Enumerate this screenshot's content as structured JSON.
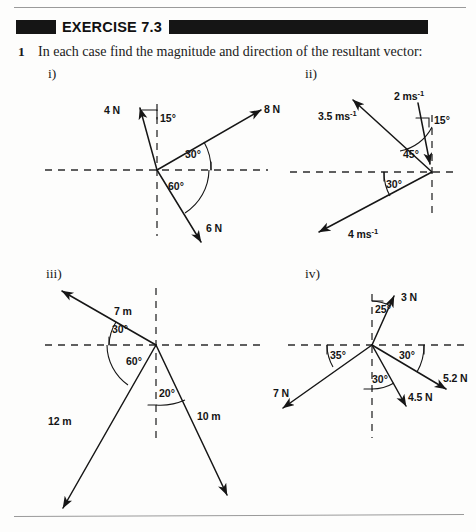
{
  "page": {
    "exercise_title": "EXERCISE 7.3",
    "question_number": "1",
    "question_text": "In each case find the magnitude and direction of the resultant vector:"
  },
  "parts": {
    "i": {
      "label": "i)",
      "vectors": [
        {
          "name": "4N-vector",
          "magnitude": "4 N"
        },
        {
          "name": "8N-vector",
          "magnitude": "8 N"
        },
        {
          "name": "6N-vector",
          "magnitude": "6 N"
        }
      ],
      "angles": [
        "15°",
        "30°",
        "60°"
      ]
    },
    "ii": {
      "label": "ii)",
      "vectors": [
        {
          "name": "2ms-vector",
          "magnitude": "2 ms",
          "exponent": "-1"
        },
        {
          "name": "3.5ms-vector",
          "magnitude": "3.5 ms",
          "exponent": "-1"
        },
        {
          "name": "4ms-vector",
          "magnitude": "4 ms",
          "exponent": "-1"
        }
      ],
      "angles": [
        "15°",
        "45°",
        "30°"
      ]
    },
    "iii": {
      "label": "iii)",
      "vectors": [
        {
          "name": "7m-vector",
          "magnitude": "7 m"
        },
        {
          "name": "12m-vector",
          "magnitude": "12 m"
        },
        {
          "name": "10m-vector",
          "magnitude": "10 m"
        }
      ],
      "angles": [
        "30°",
        "60°",
        "20°"
      ]
    },
    "iv": {
      "label": "iv)",
      "vectors": [
        {
          "name": "3N-vector",
          "magnitude": "3 N"
        },
        {
          "name": "5.2N-vector",
          "magnitude": "5.2 N"
        },
        {
          "name": "4.5N-vector",
          "magnitude": "4.5 N"
        },
        {
          "name": "7N-vector",
          "magnitude": "7 N"
        }
      ],
      "angles": [
        "25°",
        "30°",
        "30°",
        "35°"
      ]
    }
  }
}
